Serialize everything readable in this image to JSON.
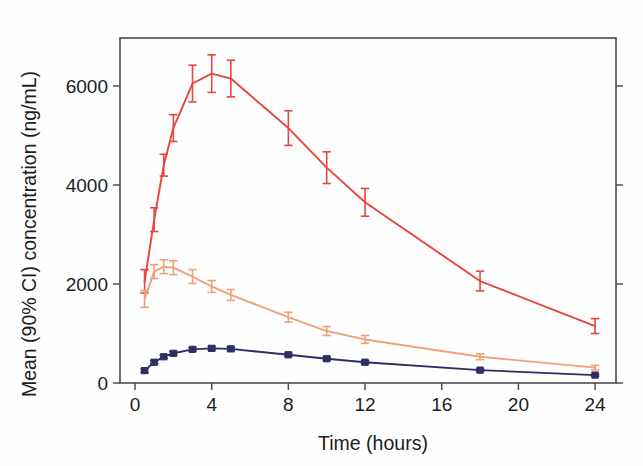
{
  "chart_data": {
    "type": "line",
    "title": "",
    "subtitle": "",
    "xlabel": "Time (hours)",
    "ylabel": "Mean (90% CI) concentration (ng/mL)",
    "xlim": [
      0,
      25.2
    ],
    "ylim": [
      0,
      7400
    ],
    "xticks": [
      0,
      4,
      8,
      12,
      16,
      20,
      24
    ],
    "xtick_labels": [
      "0",
      "4",
      "8",
      "12",
      "16",
      "20",
      "24"
    ],
    "yticks": [
      0,
      2000,
      4000,
      6000
    ],
    "ytick_labels": [
      "0",
      "2000",
      "4000",
      "6000"
    ],
    "grid": false,
    "legend": "none",
    "error_bars": "90% CI",
    "x": [
      0.5,
      1,
      1.5,
      2,
      3,
      4,
      5,
      8,
      10,
      12,
      18,
      24
    ],
    "series": [
      {
        "name": "high-dose",
        "color": "#e8453c",
        "marker": "none",
        "values": [
          2050,
          3300,
          4400,
          5150,
          6050,
          6250,
          6150,
          5150,
          4350,
          3650,
          2060,
          1150
        ],
        "ci_low": [
          1820,
          3060,
          4180,
          4880,
          5680,
          5870,
          5780,
          4800,
          4030,
          3370,
          1860,
          1000
        ],
        "ci_high": [
          2290,
          3540,
          4620,
          5420,
          6420,
          6630,
          6520,
          5500,
          4670,
          3930,
          2260,
          1300
        ]
      },
      {
        "name": "mid-dose",
        "color": "#f0a07a",
        "marker": "none",
        "values": [
          1700,
          2250,
          2350,
          2330,
          2150,
          1950,
          1780,
          1330,
          1050,
          880,
          530,
          310
        ],
        "ci_low": [
          1530,
          2110,
          2210,
          2190,
          2010,
          1830,
          1670,
          1230,
          960,
          800,
          470,
          265
        ],
        "ci_high": [
          1870,
          2390,
          2490,
          2470,
          2290,
          2070,
          1890,
          1430,
          1140,
          960,
          590,
          355
        ]
      },
      {
        "name": "low-dose",
        "color": "#2d2f62",
        "marker": "square",
        "values": [
          250,
          420,
          530,
          600,
          680,
          700,
          690,
          570,
          490,
          420,
          260,
          160
        ],
        "ci_low": [
          215,
          385,
          495,
          565,
          645,
          662,
          652,
          537,
          458,
          390,
          235,
          140
        ],
        "ci_high": [
          285,
          455,
          565,
          635,
          715,
          738,
          728,
          603,
          522,
          450,
          285,
          180
        ]
      }
    ]
  },
  "axes": {
    "x_axis_title": "Time (hours)",
    "y_axis_title": "Mean (90% CI) concentration (ng/mL)"
  }
}
